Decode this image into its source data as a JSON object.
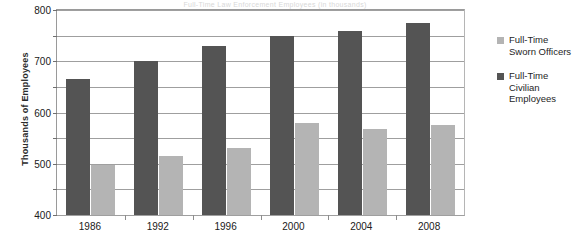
{
  "title_strip": "Full-Time Law Enforcement Employees (in thousands)",
  "chart_data": {
    "type": "bar",
    "title": "",
    "xlabel": "",
    "ylabel": "Thousands of Employees",
    "categories": [
      "1986",
      "1992",
      "1996",
      "2000",
      "2004",
      "2008"
    ],
    "series": [
      {
        "name": "Full-Time Sworn Officers",
        "color": "#b4b4b4",
        "values": [
          195,
          230,
          260,
          360,
          335,
          350
        ]
      },
      {
        "name": "Full-Time Civilian Employees",
        "color": "#545454",
        "values": [
          530,
          600,
          660,
          700,
          720,
          750
        ]
      }
    ],
    "ylim": [
      0,
      800
    ],
    "ytick_step": 100,
    "yticks": [
      "0",
      "100",
      "200",
      "300",
      "400",
      "500",
      "600",
      "700",
      "800"
    ],
    "grid": true,
    "legend_position": "right"
  },
  "legend": {
    "entries": [
      {
        "label": "Full-Time\nSworn Officers"
      },
      {
        "label": "Full-Time\nCivilian\nEmployees"
      }
    ]
  }
}
